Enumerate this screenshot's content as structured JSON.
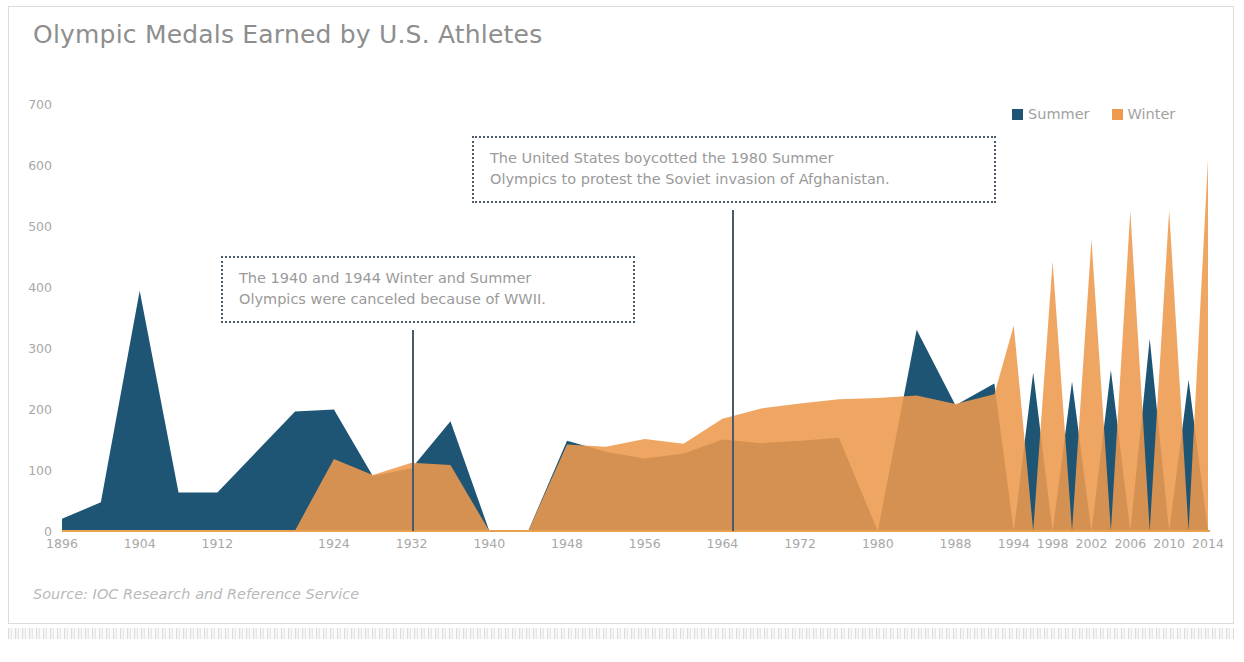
{
  "title": "Olympic Medals Earned by U.S. Athletes",
  "source": "Source: IOC Research and Reference Service",
  "legend": {
    "items": [
      {
        "label": "Summer",
        "color": "#1f5574"
      },
      {
        "label": "Winter",
        "color": "#ee9a4d"
      }
    ]
  },
  "annotations": [
    {
      "name": "wwii",
      "line1": "The 1940 and 1944 Winter and Summer",
      "line2": "Olympics were canceled because of WWII.",
      "anchor_year": 1942
    },
    {
      "name": "boycott",
      "line1": "The United States boycotted the 1980 Summer",
      "line2": "Olympics to protest the Soviet invasion of Afghanistan.",
      "anchor_year": 1980
    }
  ],
  "chart_data": {
    "type": "area",
    "title": "Olympic Medals Earned by U.S. Athletes",
    "xlabel": "",
    "ylabel": "",
    "ylim": [
      0,
      700
    ],
    "yticks": [
      0,
      100,
      200,
      300,
      400,
      500,
      600,
      700
    ],
    "xticklabels": [
      "1896",
      "1904",
      "1912",
      "1924",
      "1932",
      "1940",
      "1948",
      "1956",
      "1964",
      "1972",
      "1980",
      "1988",
      "1994",
      "1998",
      "2002",
      "2006",
      "2010",
      "2014"
    ],
    "grid": false,
    "legend_position": "top-right",
    "overlap": "overlay",
    "x": [
      1896,
      1900,
      1904,
      1908,
      1912,
      1920,
      1924,
      1928,
      1932,
      1936,
      1940,
      1944,
      1948,
      1952,
      1956,
      1960,
      1964,
      1968,
      1972,
      1976,
      1980,
      1984,
      1988,
      1992,
      1994,
      1996,
      1998,
      2000,
      2002,
      2004,
      2006,
      2008,
      2010,
      2012,
      2014
    ],
    "series": [
      {
        "name": "Summer",
        "color": "#1f5574",
        "values": [
          20,
          47,
          394,
          63,
          63,
          196,
          199,
          90,
          103,
          180,
          0,
          0,
          148,
          130,
          119,
          127,
          150,
          144,
          148,
          153,
          0,
          330,
          206,
          242,
          0,
          260,
          0,
          245,
          0,
          264,
          0,
          315,
          0,
          248,
          0
        ]
      },
      {
        "name": "Winter",
        "color": "#ee9a4d",
        "values": [
          0,
          0,
          0,
          0,
          0,
          1,
          118,
          92,
          112,
          108,
          0,
          0,
          142,
          138,
          151,
          143,
          184,
          201,
          209,
          216,
          218,
          222,
          208,
          224,
          337,
          0,
          442,
          0,
          478,
          0,
          525,
          0,
          526,
          0,
          610
        ]
      }
    ]
  }
}
